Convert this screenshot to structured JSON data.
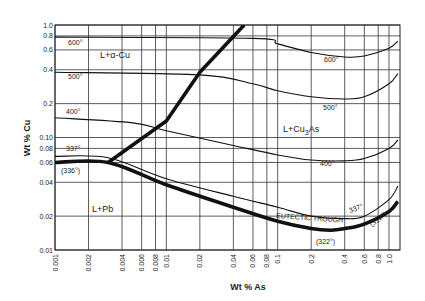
{
  "chart_data": {
    "type": "line",
    "title": "",
    "xlabel": "Wt % As",
    "ylabel": "Wt % Cu",
    "xscale": "log",
    "yscale": "log",
    "xlim": [
      0.001,
      1.2
    ],
    "ylim": [
      0.01,
      1.0
    ],
    "grid": true,
    "x_ticks": [
      "0.001",
      "0.002",
      "0.004",
      "0.006",
      "0.008",
      "0.01",
      "0.02",
      "0.04",
      "0.06",
      "0.08",
      "0.1",
      "0.2",
      "0.4",
      "0.6",
      "0.8",
      "1.0"
    ],
    "y_ticks": [
      "0.01",
      "0.02",
      "0.04",
      "0.06",
      "0.08",
      "0.10",
      "0.2",
      "0.4",
      "0.6",
      "0.8",
      "1.0"
    ],
    "regions": [
      "L+α-Cu",
      "L+Cu3As",
      "L+Pb"
    ],
    "annotations": [
      "EUTECTIC TROUGH",
      "(336°)",
      "(322°)",
      "(312°)"
    ],
    "series": [
      {
        "name": "600°",
        "kind": "isotherm",
        "x": [
          0.001,
          0.06,
          0.1,
          0.2,
          0.4,
          0.6,
          1.0,
          1.2
        ],
        "y": [
          0.78,
          0.76,
          0.68,
          0.57,
          0.52,
          0.53,
          0.62,
          0.72
        ]
      },
      {
        "name": "500°",
        "kind": "isotherm",
        "x": [
          0.001,
          0.02,
          0.06,
          0.1,
          0.2,
          0.4,
          0.6,
          1.0,
          1.2
        ],
        "y": [
          0.38,
          0.36,
          0.3,
          0.26,
          0.23,
          0.22,
          0.23,
          0.3,
          0.37
        ]
      },
      {
        "name": "400°",
        "kind": "isotherm",
        "x": [
          0.001,
          0.005,
          0.01,
          0.04,
          0.1,
          0.2,
          0.4,
          0.6,
          1.0,
          1.2
        ],
        "y": [
          0.15,
          0.135,
          0.115,
          0.085,
          0.07,
          0.063,
          0.062,
          0.065,
          0.08,
          0.095
        ]
      },
      {
        "name": "337°",
        "kind": "isotherm",
        "x": [
          0.001,
          0.003,
          0.01,
          0.04,
          0.1,
          0.2,
          0.4,
          0.6,
          1.0,
          1.2
        ],
        "y": [
          0.068,
          0.066,
          0.043,
          0.03,
          0.024,
          0.02,
          0.019,
          0.02,
          0.028,
          0.037
        ]
      },
      {
        "name": "Eutectic trough",
        "kind": "boundary",
        "x": [
          0.001,
          0.003,
          0.01,
          0.04,
          0.1,
          0.2,
          0.3,
          0.4,
          0.6,
          1.0,
          1.2
        ],
        "y": [
          0.06,
          0.06,
          0.038,
          0.024,
          0.018,
          0.0155,
          0.015,
          0.0155,
          0.017,
          0.022,
          0.027
        ]
      },
      {
        "name": "Pb / Cu3As boundary",
        "kind": "boundary",
        "x": [
          0.003,
          0.01,
          0.02,
          0.05
        ],
        "y": [
          0.06,
          0.14,
          0.38,
          1.0
        ]
      }
    ]
  }
}
